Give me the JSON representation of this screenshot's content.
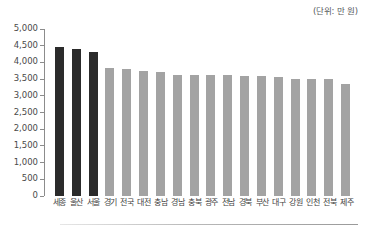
{
  "caption": {
    "unit_note": "(단위: 만 원)"
  },
  "chart_data": {
    "type": "bar",
    "title": "",
    "subtitle": "",
    "xlabel": "",
    "ylabel": "",
    "unit_note": "(단위: 만 원)",
    "ylim": [
      0,
      5000
    ],
    "ytick_step": 500,
    "grid": false,
    "legend": "none",
    "categories": [
      "세종",
      "울산",
      "서울",
      "경기",
      "전국",
      "대전",
      "충남",
      "경남",
      "충북",
      "광주",
      "전남",
      "경북",
      "부산",
      "대구",
      "강원",
      "인천",
      "전북",
      "제주"
    ],
    "values": [
      4450,
      4400,
      4320,
      3830,
      3810,
      3730,
      3700,
      3620,
      3610,
      3610,
      3620,
      3600,
      3590,
      3560,
      3500,
      3490,
      3490,
      3350
    ],
    "ytick_labels": [
      "0",
      "500",
      "1,000",
      "1,500",
      "2,000",
      "2,500",
      "3,000",
      "3,500",
      "4,000",
      "4,500",
      "5,000"
    ],
    "ytick_values": [
      0,
      500,
      1000,
      1500,
      2000,
      2500,
      3000,
      3500,
      4000,
      4500,
      5000
    ],
    "bar_colors": [
      "#2b2b2b",
      "#2b2b2b",
      "#2b2b2b",
      "#a3a3a3",
      "#a3a3a3",
      "#a3a3a3",
      "#a3a3a3",
      "#a3a3a3",
      "#a3a3a3",
      "#a3a3a3",
      "#a3a3a3",
      "#a3a3a3",
      "#a3a3a3",
      "#a3a3a3",
      "#a3a3a3",
      "#a3a3a3",
      "#a3a3a3",
      "#a3a3a3"
    ],
    "highlight_color": "#2b2b2b",
    "default_color": "#a3a3a3",
    "axis_color": "#8c8c8c"
  }
}
